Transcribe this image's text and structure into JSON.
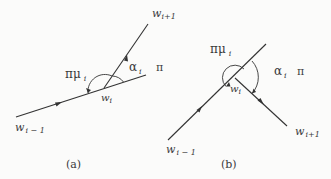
{
  "panels": [
    {
      "id": "a",
      "caption": "(a)",
      "labels": {
        "w_prev": "w",
        "w_prev_sub": "i − 1",
        "w_cur": "w",
        "w_cur_sub": "i",
        "w_next": "w",
        "w_next_sub": "i+1",
        "angle_mu": "πμ",
        "angle_mu_sub": "i",
        "alpha": "α",
        "alpha_sub": "i",
        "pi": "π"
      }
    },
    {
      "id": "b",
      "caption": "(b)",
      "labels": {
        "w_prev": "w",
        "w_prev_sub": "i − 1",
        "w_cur": "w",
        "w_cur_sub": "i",
        "w_next": "w",
        "w_next_sub": "i+1",
        "angle_mu": "πμ",
        "angle_mu_sub": "i",
        "alpha": "α",
        "alpha_sub": "i",
        "pi": "π"
      }
    }
  ],
  "colors": {
    "line": "#333333",
    "text": "#3a3a3a",
    "background": "#fbfbfa"
  }
}
